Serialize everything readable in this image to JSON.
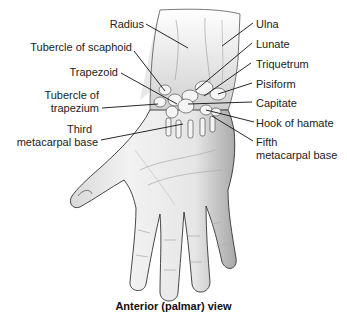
{
  "figure": {
    "caption": "Anterior (palmar) view",
    "labels_left": [
      {
        "id": "radius",
        "text": "Radius"
      },
      {
        "id": "tubercle-of-scaphoid",
        "text": "Tubercle of scaphoid"
      },
      {
        "id": "trapezoid",
        "text": "Trapezoid"
      },
      {
        "id": "tubercle-of-trapezium-1",
        "text": "Tubercle of"
      },
      {
        "id": "tubercle-of-trapezium-2",
        "text": "trapezium"
      },
      {
        "id": "third-metacarpal-base-1",
        "text": "Third"
      },
      {
        "id": "third-metacarpal-base-2",
        "text": "metacarpal base"
      }
    ],
    "labels_right": [
      {
        "id": "ulna",
        "text": "Ulna"
      },
      {
        "id": "lunate",
        "text": "Lunate"
      },
      {
        "id": "triquetrum",
        "text": "Triquetrum"
      },
      {
        "id": "pisiform",
        "text": "Pisiform"
      },
      {
        "id": "capitate",
        "text": "Capitate"
      },
      {
        "id": "hook-of-hamate",
        "text": "Hook of hamate"
      },
      {
        "id": "fifth-metacarpal-base-1",
        "text": "Fifth"
      },
      {
        "id": "fifth-metacarpal-base-2",
        "text": "metacarpal base"
      }
    ]
  }
}
